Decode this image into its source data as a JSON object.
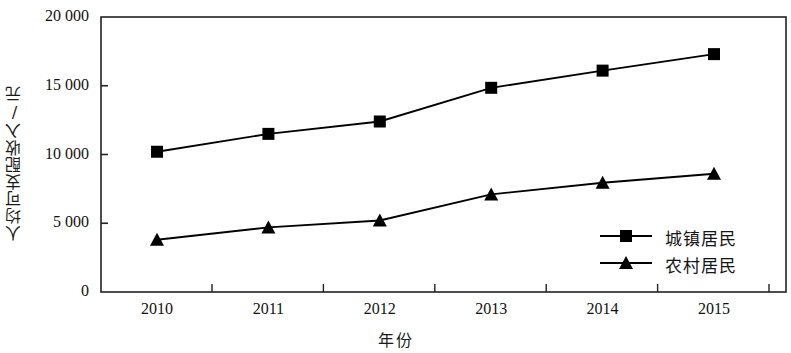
{
  "chart_data": {
    "type": "line",
    "title": "",
    "xlabel": "年份",
    "ylabel": "人均可支配收入/元",
    "categories": [
      "2010",
      "2011",
      "2012",
      "2013",
      "2014",
      "2015"
    ],
    "x": [
      2010,
      2011,
      2012,
      2013,
      2014,
      2015
    ],
    "series": [
      {
        "name": "城镇居民",
        "marker": "square",
        "color": "#000000",
        "values": [
          10200,
          11500,
          12400,
          14850,
          16100,
          17300
        ]
      },
      {
        "name": "农村居民",
        "marker": "triangle",
        "color": "#000000",
        "values": [
          3800,
          4700,
          5200,
          7100,
          7950,
          8600
        ]
      }
    ],
    "ylim": [
      0,
      20000
    ],
    "yticks": [
      0,
      5000,
      10000,
      15000,
      20000
    ],
    "ytick_labels": [
      "0",
      "5 000",
      "10 000",
      "15 000",
      "20 000"
    ],
    "grid": false,
    "legend_position": "bottom-right",
    "frame": "box"
  },
  "axes": {
    "y_title": "人均可支配收入/元",
    "x_title": "年份"
  },
  "legend": {
    "entries": [
      {
        "label": "城镇居民",
        "marker": "square"
      },
      {
        "label": "农村居民",
        "marker": "triangle"
      }
    ]
  }
}
